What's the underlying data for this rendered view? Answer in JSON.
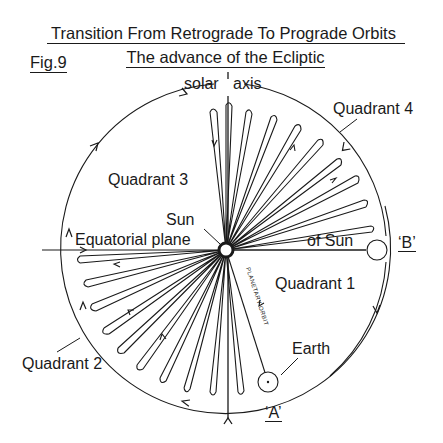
{
  "figure": {
    "title": "Transition From Retrograde To Prograde Orbits",
    "subtitle": "The advance of the Ecliptic",
    "fig_label": "Fig.9"
  },
  "labels": {
    "solar_axis_left": "solar",
    "solar_axis_right": "axis",
    "quadrant_1": "Quadrant 1",
    "quadrant_2": "Quadrant 2",
    "quadrant_3": "Quadrant 3",
    "quadrant_4": "Quadrant 4",
    "sun": "Sun",
    "equatorial_plane": "Equatorial plane",
    "of_sun": "of Sun",
    "point_b": "‘B’",
    "point_a": "‘A’",
    "earth": "Earth",
    "planetary_orbit": "PLANETARY ORBIT"
  },
  "colors": {
    "ink": "#1a1a1a",
    "background": "#ffffff"
  },
  "geometry": {
    "circle_center": [
      226,
      248
    ],
    "circle_radius": 165,
    "sun_center": [
      226,
      250
    ],
    "sun_radius": 6,
    "earth_center": [
      268,
      382
    ],
    "earth_radius": 10,
    "b_orbit_center": [
      376,
      250
    ],
    "b_orbit_radius": 10
  }
}
